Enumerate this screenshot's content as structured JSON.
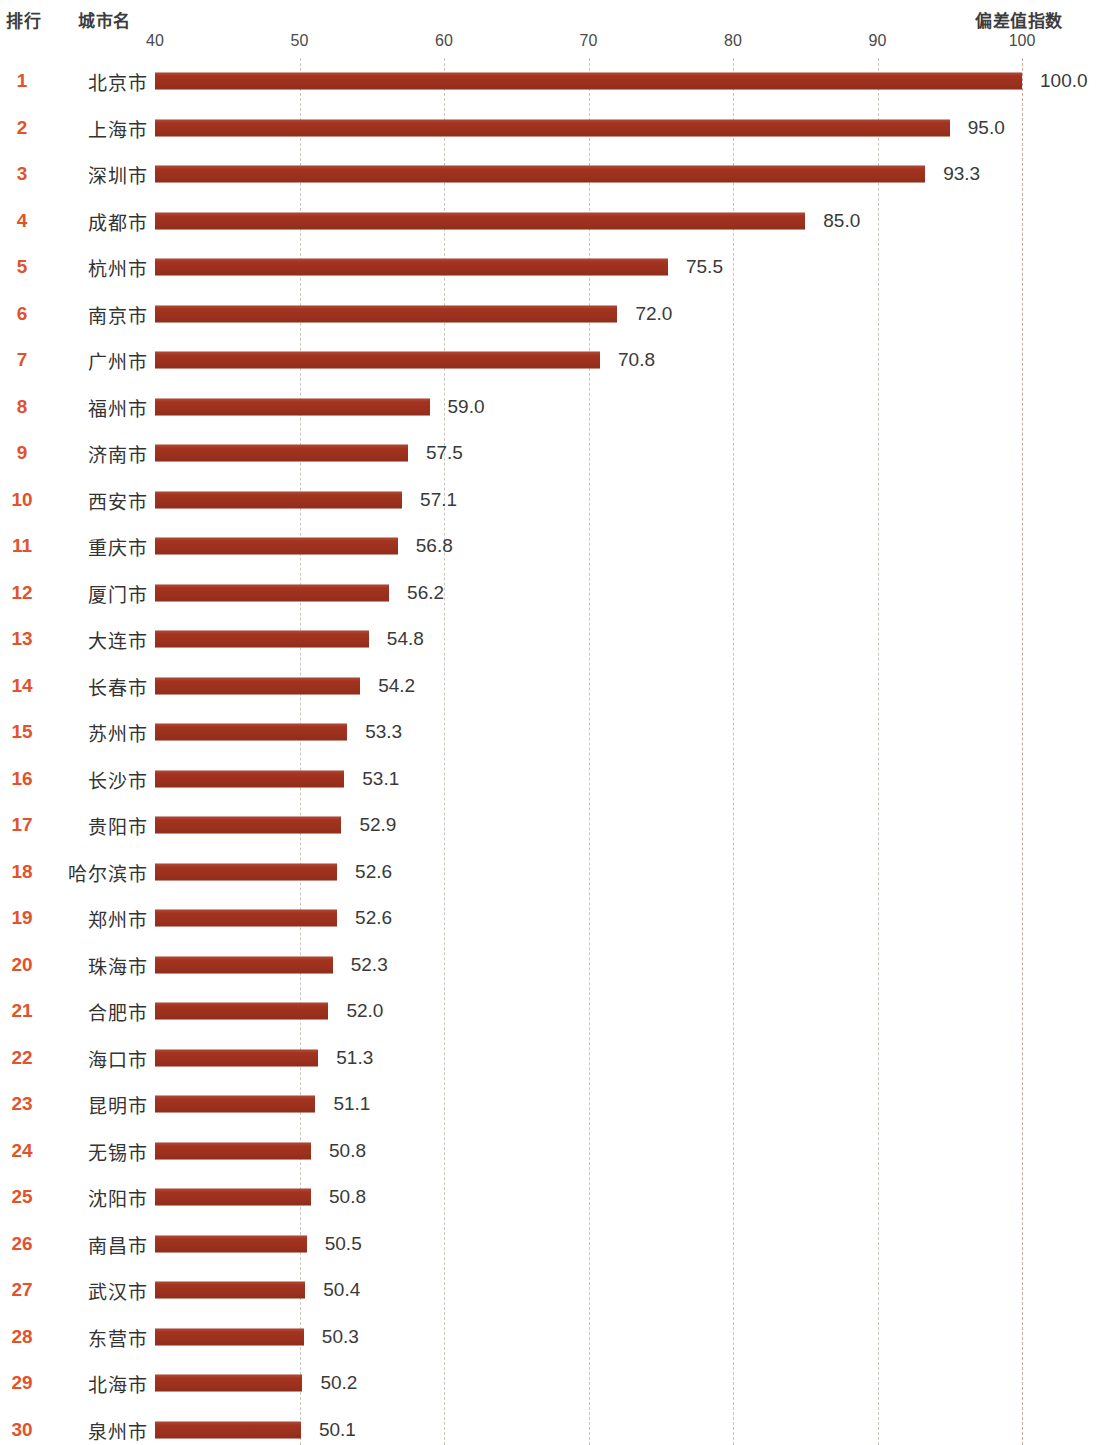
{
  "header": {
    "rank_label": "排行",
    "city_label": "城市名",
    "index_label": "偏差值指数"
  },
  "axis": {
    "ticks": [
      40,
      50,
      60,
      70,
      80,
      90,
      100
    ],
    "min": 40,
    "max": 100,
    "left_px": 155,
    "right_px": 1022
  },
  "colors": {
    "bar": "#a3331f",
    "rank": "#e2522c",
    "gridline": "#c9c6bd",
    "text": "#3a3a3a",
    "background": "#ffffff"
  },
  "chart_data": {
    "type": "bar",
    "orientation": "horizontal",
    "title": "",
    "subtitle": "",
    "xlabel": "偏差值指数",
    "ylabel": "城市名",
    "xlim": [
      40,
      100
    ],
    "xticks": [
      40,
      50,
      60,
      70,
      80,
      90,
      100
    ],
    "grid": true,
    "legend": null,
    "categories": [
      "北京市",
      "上海市",
      "深圳市",
      "成都市",
      "杭州市",
      "南京市",
      "广州市",
      "福州市",
      "济南市",
      "西安市",
      "重庆市",
      "厦门市",
      "大连市",
      "长春市",
      "苏州市",
      "长沙市",
      "贵阳市",
      "哈尔滨市",
      "郑州市",
      "珠海市",
      "合肥市",
      "海口市",
      "昆明市",
      "无锡市",
      "沈阳市",
      "南昌市",
      "武汉市",
      "东营市",
      "北海市",
      "泉州市"
    ],
    "values": [
      100.0,
      95.0,
      93.3,
      85.0,
      75.5,
      72.0,
      70.8,
      59.0,
      57.5,
      57.1,
      56.8,
      56.2,
      54.8,
      54.2,
      53.3,
      53.1,
      52.9,
      52.6,
      52.6,
      52.3,
      52.0,
      51.3,
      51.1,
      50.8,
      50.8,
      50.5,
      50.4,
      50.3,
      50.2,
      50.1
    ],
    "ranks": [
      1,
      2,
      3,
      4,
      5,
      6,
      7,
      8,
      9,
      10,
      11,
      12,
      13,
      14,
      15,
      16,
      17,
      18,
      19,
      20,
      21,
      22,
      23,
      24,
      25,
      26,
      27,
      28,
      29,
      30
    ],
    "data_labels": [
      "100.0",
      "95.0",
      "93.3",
      "85.0",
      "75.5",
      "72.0",
      "70.8",
      "59.0",
      "57.5",
      "57.1",
      "56.8",
      "56.2",
      "54.8",
      "54.2",
      "53.3",
      "53.1",
      "52.9",
      "52.6",
      "52.6",
      "52.3",
      "52.0",
      "51.3",
      "51.1",
      "50.8",
      "50.8",
      "50.5",
      "50.4",
      "50.3",
      "50.2",
      "50.1"
    ],
    "rows": [
      {
        "rank": "1",
        "city": "北京市",
        "value": 100.0,
        "label": "100.0"
      },
      {
        "rank": "2",
        "city": "上海市",
        "value": 95.0,
        "label": "95.0"
      },
      {
        "rank": "3",
        "city": "深圳市",
        "value": 93.3,
        "label": "93.3"
      },
      {
        "rank": "4",
        "city": "成都市",
        "value": 85.0,
        "label": "85.0"
      },
      {
        "rank": "5",
        "city": "杭州市",
        "value": 75.5,
        "label": "75.5"
      },
      {
        "rank": "6",
        "city": "南京市",
        "value": 72.0,
        "label": "72.0"
      },
      {
        "rank": "7",
        "city": "广州市",
        "value": 70.8,
        "label": "70.8"
      },
      {
        "rank": "8",
        "city": "福州市",
        "value": 59.0,
        "label": "59.0"
      },
      {
        "rank": "9",
        "city": "济南市",
        "value": 57.5,
        "label": "57.5"
      },
      {
        "rank": "10",
        "city": "西安市",
        "value": 57.1,
        "label": "57.1"
      },
      {
        "rank": "11",
        "city": "重庆市",
        "value": 56.8,
        "label": "56.8"
      },
      {
        "rank": "12",
        "city": "厦门市",
        "value": 56.2,
        "label": "56.2"
      },
      {
        "rank": "13",
        "city": "大连市",
        "value": 54.8,
        "label": "54.8"
      },
      {
        "rank": "14",
        "city": "长春市",
        "value": 54.2,
        "label": "54.2"
      },
      {
        "rank": "15",
        "city": "苏州市",
        "value": 53.3,
        "label": "53.3"
      },
      {
        "rank": "16",
        "city": "长沙市",
        "value": 53.1,
        "label": "53.1"
      },
      {
        "rank": "17",
        "city": "贵阳市",
        "value": 52.9,
        "label": "52.9"
      },
      {
        "rank": "18",
        "city": "哈尔滨市",
        "value": 52.6,
        "label": "52.6"
      },
      {
        "rank": "19",
        "city": "郑州市",
        "value": 52.6,
        "label": "52.6"
      },
      {
        "rank": "20",
        "city": "珠海市",
        "value": 52.3,
        "label": "52.3"
      },
      {
        "rank": "21",
        "city": "合肥市",
        "value": 52.0,
        "label": "52.0"
      },
      {
        "rank": "22",
        "city": "海口市",
        "value": 51.3,
        "label": "51.3"
      },
      {
        "rank": "23",
        "city": "昆明市",
        "value": 51.1,
        "label": "51.1"
      },
      {
        "rank": "24",
        "city": "无锡市",
        "value": 50.8,
        "label": "50.8"
      },
      {
        "rank": "25",
        "city": "沈阳市",
        "value": 50.8,
        "label": "50.8"
      },
      {
        "rank": "26",
        "city": "南昌市",
        "value": 50.5,
        "label": "50.5"
      },
      {
        "rank": "27",
        "city": "武汉市",
        "value": 50.4,
        "label": "50.4"
      },
      {
        "rank": "28",
        "city": "东营市",
        "value": 50.3,
        "label": "50.3"
      },
      {
        "rank": "29",
        "city": "北海市",
        "value": 50.2,
        "label": "50.2"
      },
      {
        "rank": "30",
        "city": "泉州市",
        "value": 50.1,
        "label": "50.1"
      }
    ]
  }
}
